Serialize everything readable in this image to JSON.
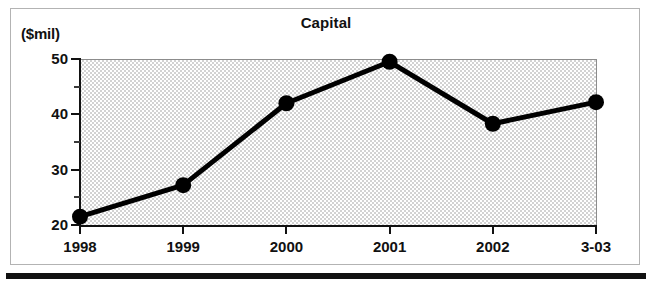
{
  "figure": {
    "unit_label": "($mil)",
    "title": "Capital"
  },
  "chart_data": {
    "type": "line",
    "title": "Capital",
    "xlabel": "",
    "ylabel": "($mil)",
    "unit": "$mil",
    "categories": [
      "1998",
      "1999",
      "2000",
      "2001",
      "2002",
      "3-03"
    ],
    "values": [
      21.5,
      27.2,
      42.0,
      49.5,
      38.3,
      42.2
    ],
    "series": [
      {
        "name": "Capital",
        "values": [
          21.5,
          27.2,
          42.0,
          49.5,
          38.3,
          42.2
        ]
      }
    ],
    "ylim": [
      20,
      50
    ],
    "y_major_ticks": [
      20,
      30,
      40,
      50
    ],
    "y_minor_ticks": [
      25,
      35,
      45
    ],
    "y_tick_labels": [
      "20",
      "30",
      "40",
      "50"
    ],
    "x_tick_labels": [
      "1998",
      "1999",
      "2000",
      "2001",
      "2002",
      "3-03"
    ],
    "grid": false,
    "legend": false,
    "legend_position": "none",
    "marker": "filled-circle",
    "line_color": "#000000",
    "marker_color": "#000000",
    "plot_background": "#d2d2d2"
  }
}
